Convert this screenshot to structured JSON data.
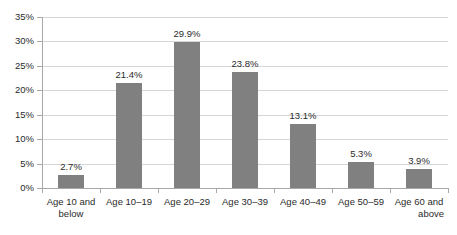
{
  "chart_data": {
    "type": "bar",
    "title": "",
    "subtitle": "",
    "xlabel": "",
    "ylabel": "",
    "categories": [
      "Age 10 and below",
      "Age 10–19",
      "Age 20–29",
      "Age 30–39",
      "Age 40–49",
      "Age 50–59",
      "Age 60 and above"
    ],
    "category_lines": [
      [
        "Age 10 and",
        "below"
      ],
      [
        "Age 10–19",
        ""
      ],
      [
        "Age 20–29",
        ""
      ],
      [
        "Age 30–39",
        ""
      ],
      [
        "Age 40–49",
        ""
      ],
      [
        "Age 50–59",
        ""
      ],
      [
        "Age 60 and",
        "above"
      ]
    ],
    "values": [
      2.7,
      21.4,
      29.9,
      23.8,
      13.1,
      5.3,
      3.9
    ],
    "data_labels": [
      "2.7%",
      "21.4%",
      "29.9%",
      "23.8%",
      "13.1%",
      "5.3%",
      "3.9%"
    ],
    "ylim": [
      0,
      35
    ],
    "ytick_values": [
      0,
      5,
      10,
      15,
      20,
      25,
      30,
      35
    ],
    "ytick_labels": [
      "0%",
      "5%",
      "10%",
      "15%",
      "20%",
      "25%",
      "30%",
      "35%"
    ],
    "grid": true,
    "legend": false,
    "legend_position": "none",
    "bar_color": "#808080",
    "gridline_color": "#d6d6d6",
    "axis_color": "#a8a8a8",
    "text_color": "#2b2b2b",
    "background_color": "#ffffff"
  }
}
